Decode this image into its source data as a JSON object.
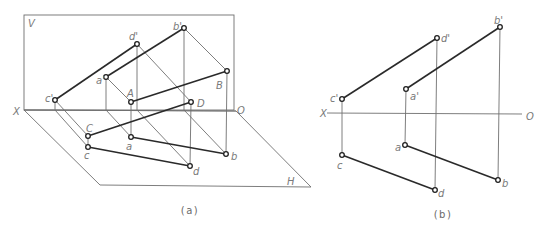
{
  "figure_a": {
    "caption": "(a)",
    "planes": {
      "V": {
        "label": "V",
        "rect": [
          24,
          15,
          234,
          110
        ],
        "label_pos": [
          28,
          27
        ]
      },
      "H": {
        "label": "H",
        "polygon": [
          [
            24,
            110
          ],
          [
            100,
            185
          ],
          [
            311,
            187
          ],
          [
            236,
            111
          ]
        ],
        "label_pos": [
          287,
          185
        ]
      },
      "axis": {
        "x_label": "X",
        "o_label": "O",
        "from": [
          24,
          110
        ],
        "to": [
          236,
          111
        ],
        "x_label_pos": [
          13,
          115
        ],
        "o_label_pos": [
          237,
          114
        ]
      }
    },
    "points": [
      {
        "id": "c_prime",
        "label": "c'",
        "x": 55,
        "y": 100,
        "lx": 45,
        "ly": 102
      },
      {
        "id": "d_prime",
        "label": "d'",
        "x": 137,
        "y": 44,
        "lx": 129,
        "ly": 40
      },
      {
        "id": "a_prime",
        "label": "a'",
        "x": 106,
        "y": 77,
        "lx": 96,
        "ly": 84
      },
      {
        "id": "b_prime",
        "label": "b'",
        "x": 184,
        "y": 28,
        "lx": 173,
        "ly": 30
      },
      {
        "id": "A",
        "label": "A",
        "x": 131,
        "y": 102,
        "lx": 127,
        "ly": 97
      },
      {
        "id": "B",
        "label": "B",
        "x": 227,
        "y": 71,
        "lx": 216,
        "ly": 89
      },
      {
        "id": "D",
        "label": "D",
        "x": 191,
        "y": 102,
        "lx": 197,
        "ly": 107
      },
      {
        "id": "C",
        "label": "C",
        "x": 88,
        "y": 136,
        "lx": 86,
        "ly": 132
      },
      {
        "id": "c",
        "label": "c",
        "x": 88,
        "y": 147,
        "lx": 84,
        "ly": 159
      },
      {
        "id": "a",
        "label": "a",
        "x": 131,
        "y": 137,
        "lx": 126,
        "ly": 150
      },
      {
        "id": "b",
        "label": "b",
        "x": 226,
        "y": 154,
        "lx": 231,
        "ly": 160
      },
      {
        "id": "d",
        "label": "d",
        "x": 190,
        "y": 166,
        "lx": 193,
        "ly": 175
      }
    ],
    "thick_lines": [
      [
        55,
        100,
        137,
        44
      ],
      [
        106,
        77,
        184,
        28
      ],
      [
        131,
        102,
        227,
        71
      ],
      [
        88,
        136,
        191,
        102
      ],
      [
        131,
        137,
        226,
        154
      ],
      [
        88,
        147,
        190,
        166
      ]
    ],
    "thin_lines": [
      [
        55,
        100,
        55,
        110
      ],
      [
        55,
        110,
        88,
        147
      ],
      [
        55,
        100,
        88,
        136
      ],
      [
        88,
        136,
        88,
        147
      ],
      [
        106,
        77,
        106,
        110
      ],
      [
        106,
        110,
        131,
        137
      ],
      [
        106,
        77,
        131,
        102
      ],
      [
        131,
        102,
        131,
        137
      ],
      [
        137,
        44,
        137,
        110
      ],
      [
        137,
        110,
        190,
        166
      ],
      [
        137,
        44,
        191,
        102
      ],
      [
        191,
        102,
        190,
        166
      ],
      [
        184,
        28,
        184,
        110
      ],
      [
        184,
        110,
        226,
        154
      ],
      [
        184,
        28,
        227,
        71
      ],
      [
        227,
        71,
        226,
        154
      ]
    ],
    "caption_pos": [
      190,
      214
    ]
  },
  "figure_b": {
    "caption": "(b)",
    "axis": {
      "x_label": "X",
      "o_label": "O",
      "from": [
        327,
        113
      ],
      "to": [
        522,
        114
      ],
      "x_label_pos": [
        320,
        117
      ],
      "o_label_pos": [
        526,
        120
      ]
    },
    "points": [
      {
        "id": "c_prime",
        "label": "c'",
        "x": 342,
        "y": 99,
        "lx": 330,
        "ly": 102
      },
      {
        "id": "d_prime",
        "label": "d'",
        "x": 437,
        "y": 38,
        "lx": 441,
        "ly": 42
      },
      {
        "id": "a_prime",
        "label": "a'",
        "x": 406,
        "y": 89,
        "lx": 410,
        "ly": 100
      },
      {
        "id": "b_prime",
        "label": "b'",
        "x": 500,
        "y": 27,
        "lx": 494,
        "ly": 24
      },
      {
        "id": "c",
        "label": "c",
        "x": 342,
        "y": 155,
        "lx": 337,
        "ly": 169
      },
      {
        "id": "a",
        "label": "a",
        "x": 405,
        "y": 145,
        "lx": 395,
        "ly": 151
      },
      {
        "id": "d",
        "label": "d",
        "x": 435,
        "y": 190,
        "lx": 438,
        "ly": 197
      },
      {
        "id": "b",
        "label": "b",
        "x": 498,
        "y": 180,
        "lx": 502,
        "ly": 187
      }
    ],
    "thick_lines": [
      [
        342,
        99,
        437,
        38
      ],
      [
        406,
        89,
        500,
        27
      ],
      [
        342,
        155,
        435,
        190
      ],
      [
        405,
        145,
        498,
        180
      ]
    ],
    "thin_lines": [
      [
        342,
        99,
        342,
        155
      ],
      [
        406,
        89,
        405,
        145
      ],
      [
        437,
        38,
        435,
        190
      ],
      [
        500,
        27,
        498,
        180
      ]
    ],
    "caption_pos": [
      443,
      218
    ]
  },
  "colors": {
    "thick_line": "#2a2a2a",
    "thin_line": "#6f6f6f",
    "label": "#7a7a7a",
    "background": "#ffffff"
  }
}
